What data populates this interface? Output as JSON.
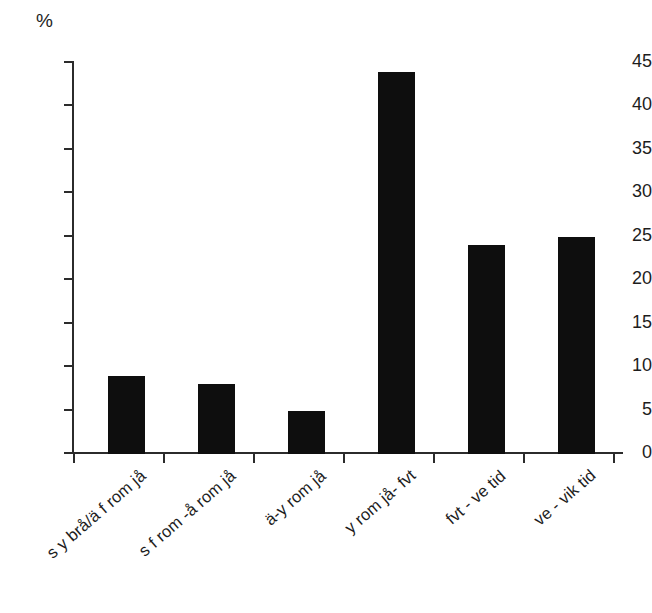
{
  "chart_data": {
    "type": "bar",
    "title": "",
    "subtitle": "",
    "xlabel": "",
    "ylabel": "%",
    "ylim": [
      0,
      45
    ],
    "yticks": [
      0,
      5,
      10,
      15,
      20,
      25,
      30,
      35,
      40,
      45
    ],
    "grid": false,
    "legend": null,
    "bar_color": "#0e0e0e",
    "axis_color": "#2b2b2b",
    "background": "#ffffff",
    "categories": [
      "s y brå/ä f rom jå",
      "s f rom -å rom jå",
      "ä-y rom jå",
      "y rom jå- fvt",
      "fvt - ve tid",
      "ve - vik tid"
    ],
    "values": [
      9,
      8,
      5,
      44,
      24,
      25
    ],
    "value_labels": [
      "9",
      "8",
      "5",
      "44",
      "24",
      "25"
    ]
  }
}
